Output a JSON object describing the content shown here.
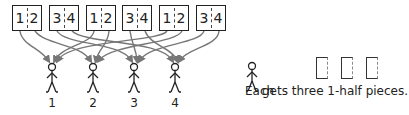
{
  "boxes": [
    {
      "left": "1",
      "right": "2"
    },
    {
      "left": "3",
      "right": "4"
    },
    {
      "left": "1",
      "right": "2"
    },
    {
      "left": "3",
      "right": "4"
    },
    {
      "left": "1",
      "right": "2"
    },
    {
      "left": "3",
      "right": "4"
    }
  ],
  "people": [
    {
      "label": "1"
    },
    {
      "label": "2"
    },
    {
      "label": "3"
    },
    {
      "label": "4"
    }
  ],
  "caption": {
    "prefix": "Each",
    "suffix": "gets three 1-half pieces."
  },
  "pieces_count": 3,
  "colors": {
    "arrow": "#777777",
    "stroke": "#222222"
  }
}
